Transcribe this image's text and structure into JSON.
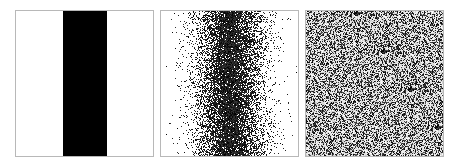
{
  "figure": {
    "panels": [
      {
        "id": "p1",
        "name": "sharp-band",
        "band_center": 0.5,
        "band_width": 0.32,
        "spread": 0.0,
        "density": 1.0
      },
      {
        "id": "p2",
        "name": "diffused-band",
        "band_center": 0.5,
        "band_width": 0.32,
        "spread": 0.22,
        "density": 0.95
      },
      {
        "id": "p3",
        "name": "uniform-noise",
        "band_center": 0.5,
        "band_width": 0.32,
        "spread": 10.0,
        "density": 0.42
      }
    ],
    "colors": {
      "ink": "#000000",
      "background": "#ffffff",
      "border": "#b8b8b8"
    }
  }
}
